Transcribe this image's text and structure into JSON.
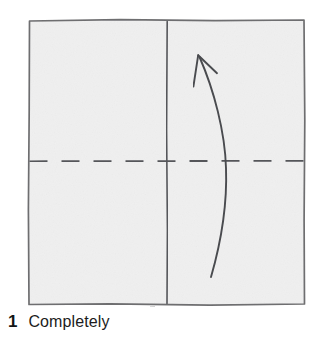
{
  "figure": {
    "kind": "origami-fold-diagram",
    "paper": {
      "fill_color": "#f0f0f0",
      "edge_color": "#6e6e70",
      "shape": "square",
      "bounds": {
        "x": 28,
        "y": 20,
        "width": 277,
        "height": 285
      }
    },
    "lines": [
      {
        "name": "vertical-center-line",
        "style": "solid",
        "color": "#55565a",
        "orientation": "vertical",
        "position_x": 167,
        "from_y": 21,
        "to_y": 304
      },
      {
        "name": "horizontal-fold-line",
        "style": "dashed",
        "color": "#55565a",
        "orientation": "horizontal",
        "position_y": 161,
        "from_x": 29,
        "to_x": 304,
        "dash_length": 18,
        "gap_length": 14
      }
    ],
    "arrow": {
      "name": "fold-up-arrow",
      "color": "#4a4b4f",
      "direction": "up",
      "meaning": "fold bottom edge upward",
      "tail": {
        "x": 211,
        "y": 277
      },
      "tip": {
        "x": 198,
        "y": 55
      },
      "bulge": {
        "x": 226,
        "y": 168
      },
      "barb_left": {
        "x": 193,
        "y": 86
      },
      "barb_right": {
        "x": 217,
        "y": 73
      }
    }
  },
  "caption": {
    "step_number": "1",
    "text": "Completely"
  },
  "colors": {
    "page_background": "#ffffff",
    "paper_fill": "#f0f0f0",
    "ink": "#55565a",
    "caption_ink": "#1c1c1c"
  }
}
